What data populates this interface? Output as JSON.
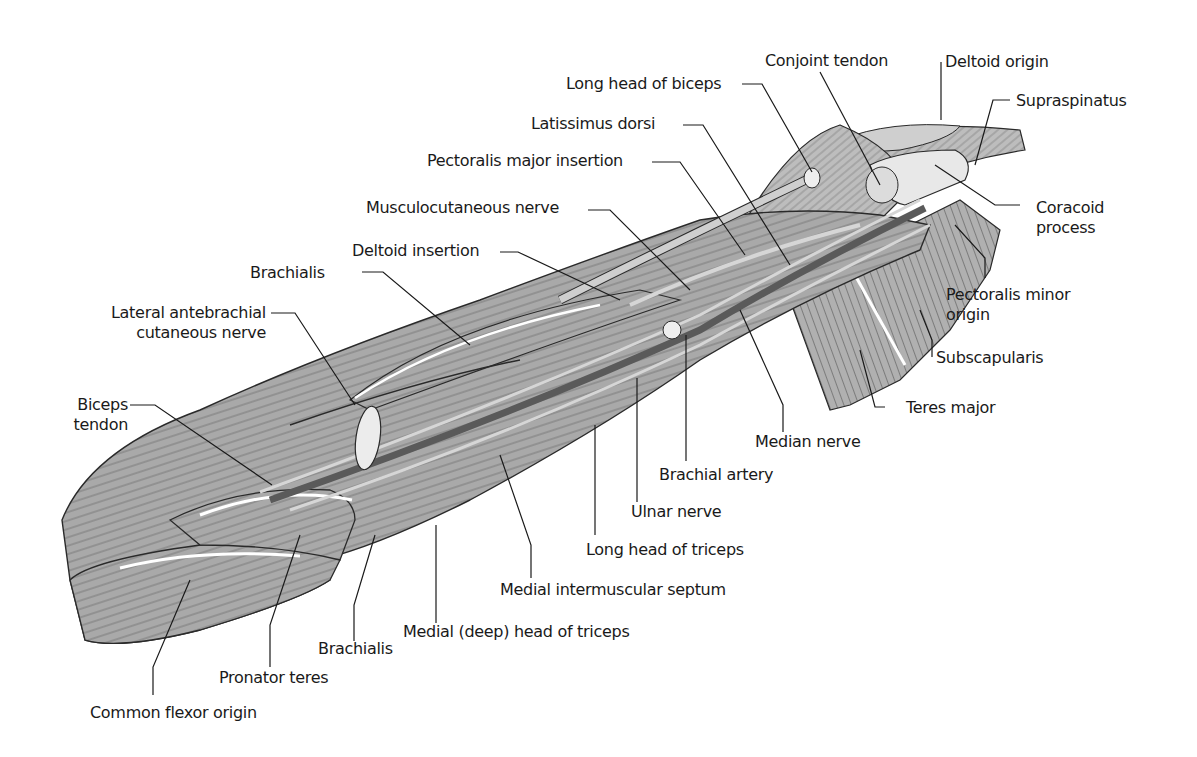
{
  "diagram": {
    "colors": {
      "muscle": "#a9a9a9",
      "muscle_dark": "#8c8c8c",
      "artery": "#5a5a5a",
      "outline": "#2a2a2a",
      "tendon": "#e6e6e6",
      "leader": "#1a1a1a"
    },
    "labels": {
      "long_head_biceps": "Long head of biceps",
      "conjoint_tendon": "Conjoint tendon",
      "deltoid_origin": "Deltoid origin",
      "supraspinatus": "Supraspinatus",
      "latissimus_dorsi": "Latissimus dorsi",
      "pectoralis_major_insertion": "Pectoralis major insertion",
      "coracoid_process_1": "Coracoid",
      "coracoid_process_2": "process",
      "musculocutaneous_nerve": "Musculocutaneous nerve",
      "deltoid_insertion": "Deltoid insertion",
      "brachialis_top": "Brachialis",
      "pectoralis_minor_origin_1": "Pectoralis minor",
      "pectoralis_minor_origin_2": "origin",
      "lateral_antebrachial_1": "Lateral antebrachial",
      "lateral_antebrachial_2": "cutaneous nerve",
      "subscapularis": "Subscapularis",
      "biceps_tendon_1": "Biceps",
      "biceps_tendon_2": "tendon",
      "teres_major": "Teres major",
      "median_nerve": "Median nerve",
      "brachial_artery": "Brachial artery",
      "ulnar_nerve": "Ulnar nerve",
      "long_head_triceps": "Long head of triceps",
      "medial_intermuscular_septum": "Medial intermuscular septum",
      "medial_deep_head_triceps": "Medial (deep) head of triceps",
      "brachialis_bottom": "Brachialis",
      "pronator_teres": "Pronator teres",
      "common_flexor_origin": "Common flexor origin"
    }
  }
}
